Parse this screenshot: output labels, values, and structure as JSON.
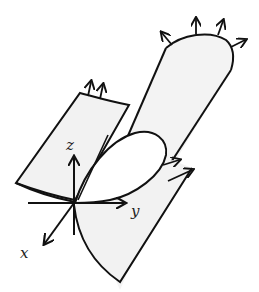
{
  "figure": {
    "colors": {
      "stroke": "#111111",
      "surface_fill": "#f2f2f2",
      "background": "#ffffff"
    },
    "axes": {
      "x_label": "x",
      "y_label": "y",
      "z_label": "z"
    }
  }
}
